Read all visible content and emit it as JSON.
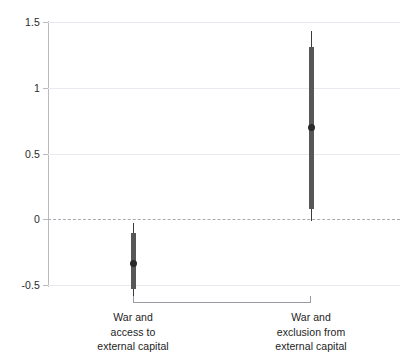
{
  "chart_data": {
    "type": "scatter",
    "subtype": "coefficient-plot-with-error-bars",
    "title": "",
    "subtitle": "",
    "xlabel": "",
    "ylabel": "",
    "ylim": [
      -0.5,
      1.5
    ],
    "yticks": [
      -0.5,
      0,
      0.5,
      1,
      1.5
    ],
    "ytick_labels": [
      "-0.5",
      "0",
      "0.5",
      "1",
      "1.5"
    ],
    "grid": true,
    "grid_axis": "y",
    "legend": false,
    "zero_reference_line": {
      "value": 0,
      "style": "dashed",
      "color": "#a9a9b2"
    },
    "categories": [
      "War and access to external capital",
      "War and exclusion from external capital"
    ],
    "category_label_lines": [
      [
        "War and",
        "access to",
        "external capital"
      ],
      [
        "War and",
        "exclusion from",
        "external capital"
      ]
    ],
    "points": [
      {
        "category": "War and access to external capital",
        "estimate": -0.33,
        "inner_low": -0.52,
        "inner_high": -0.1,
        "outer_low": -0.58,
        "outer_high": -0.02
      },
      {
        "category": "War and exclusion from external capital",
        "estimate": 0.7,
        "inner_low": 0.08,
        "inner_high": 1.31,
        "outer_low": -0.01,
        "outer_high": 1.43
      }
    ],
    "colors": {
      "point": "#2a2a2a",
      "inner_interval": "#575757",
      "outer_interval": "#3a3a3a",
      "gridline": "#e9e9ef",
      "zero_line": "#a9a9b2",
      "axis": "#b9b9c0",
      "text": "#1d1d1d",
      "background": "#ffffff"
    }
  },
  "axis": {
    "y_ticks": [
      {
        "label": "1.5",
        "value": 1.5
      },
      {
        "label": "1",
        "value": 1
      },
      {
        "label": "0.5",
        "value": 0.5
      },
      {
        "label": "0",
        "value": 0
      },
      {
        "label": "-0.5",
        "value": -0.5
      }
    ]
  },
  "bracket": {
    "label": ""
  }
}
